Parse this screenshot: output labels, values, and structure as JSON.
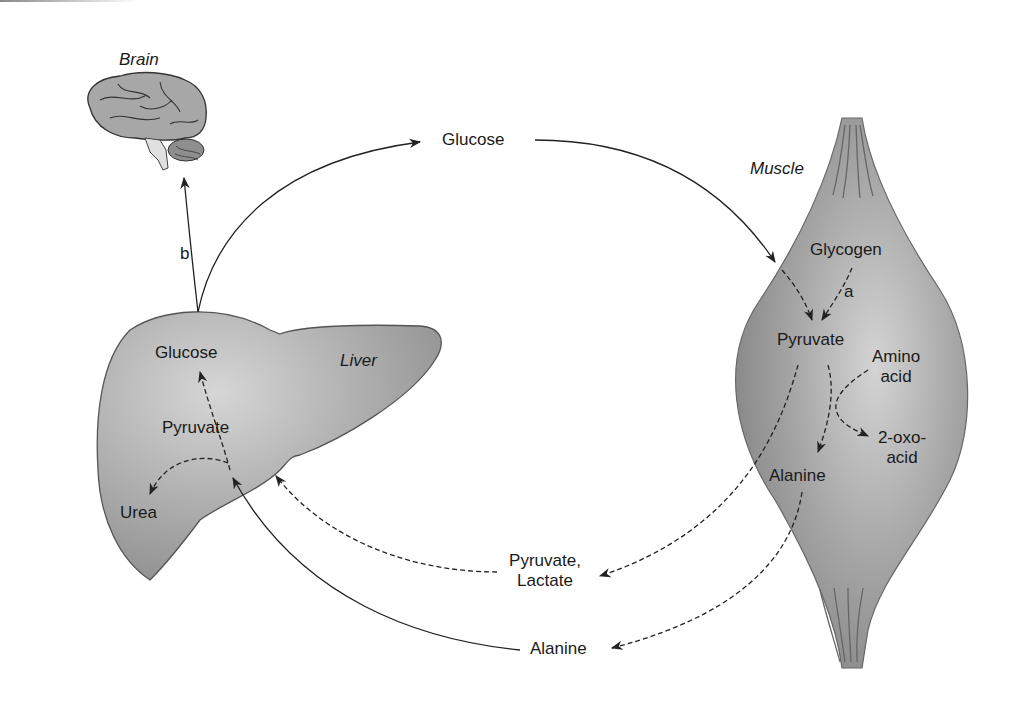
{
  "organs": {
    "brain": "Brain",
    "liver": "Liver",
    "muscle": "Muscle"
  },
  "liver_labels": {
    "glucose": "Glucose",
    "pyruvate": "Pyruvate",
    "urea": "Urea"
  },
  "muscle_labels": {
    "glycogen": "Glycogen",
    "a": "a",
    "pyruvate": "Pyruvate",
    "amino_acid_1": "Amino",
    "amino_acid_2": "acid",
    "oxo_1": "2-oxo-",
    "oxo_2": "acid",
    "alanine": "Alanine"
  },
  "blood_labels": {
    "glucose": "Glucose",
    "pyruvate_lactate_1": "Pyruvate,",
    "pyruvate_lactate_2": "Lactate",
    "alanine": "Alanine",
    "b": "b"
  },
  "colors": {
    "organ_fill": "#a8a8a8",
    "organ_stroke": "#555555",
    "arrow": "#222222"
  }
}
